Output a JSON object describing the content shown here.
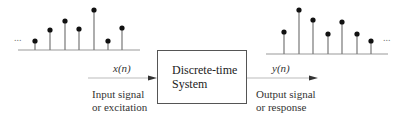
{
  "input": {
    "signal_label": "x(n)",
    "description_line1": "Input signal",
    "description_line2": "or excitation",
    "ellipsis": "...",
    "samples": [
      {
        "x": 35,
        "top": 41
      },
      {
        "x": 50,
        "top": 30
      },
      {
        "x": 65,
        "top": 21
      },
      {
        "x": 79,
        "top": 29
      },
      {
        "x": 94,
        "top": 10
      },
      {
        "x": 108,
        "top": 41
      },
      {
        "x": 122,
        "top": 28
      }
    ],
    "baseline_y": 50
  },
  "system": {
    "label_line1": "Discrete-time",
    "label_line2": "System"
  },
  "output": {
    "signal_label": "y(n)",
    "description_line1": "Output signal",
    "description_line2": "or response",
    "ellipsis": "...",
    "samples": [
      {
        "x": 284,
        "top": 32
      },
      {
        "x": 299,
        "top": 10
      },
      {
        "x": 313,
        "top": 20
      },
      {
        "x": 328,
        "top": 34
      },
      {
        "x": 342,
        "top": 22
      },
      {
        "x": 357,
        "top": 34
      },
      {
        "x": 371,
        "top": 41
      }
    ],
    "baseline_y": 54
  },
  "colors": {
    "stroke": "#333333",
    "stem": "#777777",
    "dot": "#111111"
  }
}
